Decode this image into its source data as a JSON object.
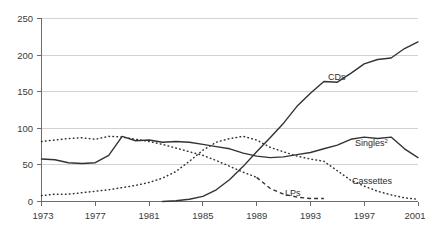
{
  "chart_data": {
    "type": "line",
    "title": "",
    "xlabel": "",
    "ylabel": "",
    "xlim": [
      1973,
      2001
    ],
    "ylim": [
      0,
      250
    ],
    "yticks": [
      0,
      50,
      100,
      150,
      200,
      250
    ],
    "xticks": [
      1973,
      1977,
      1981,
      1985,
      1989,
      1993,
      1997,
      2001
    ],
    "grid": true,
    "legend_position": "inline-annotations",
    "x": [
      1973,
      1974,
      1975,
      1976,
      1977,
      1978,
      1979,
      1980,
      1981,
      1982,
      1983,
      1984,
      1985,
      1986,
      1987,
      1988,
      1989,
      1990,
      1991,
      1992,
      1993,
      1994,
      1995,
      1996,
      1997,
      1998,
      1999,
      2000,
      2001
    ],
    "series": [
      {
        "name": "CDs",
        "style": "solid",
        "label": "CDs",
        "values": [
          0,
          0,
          0,
          0,
          0,
          0,
          0,
          0,
          0,
          0,
          1,
          3,
          7,
          16,
          30,
          48,
          68,
          87,
          107,
          130,
          148,
          164,
          163,
          175,
          188,
          194,
          196,
          209,
          218
        ]
      },
      {
        "name": "Singles",
        "style": "solid",
        "label": "Singles",
        "label_superscript": "2",
        "values": [
          58,
          57,
          53,
          52,
          53,
          63,
          89,
          83,
          84,
          81,
          82,
          81,
          78,
          75,
          72,
          66,
          62,
          60,
          61,
          64,
          67,
          72,
          77,
          85,
          88,
          86,
          88,
          72,
          60
        ]
      },
      {
        "name": "Cassettes",
        "style": "dotted",
        "label": "Cassettes",
        "values": [
          8,
          10,
          10,
          12,
          14,
          16,
          19,
          22,
          26,
          32,
          41,
          55,
          70,
          81,
          86,
          89,
          84,
          74,
          68,
          62,
          58,
          55,
          42,
          29,
          21,
          14,
          9,
          5,
          3
        ]
      },
      {
        "name": "LPs",
        "style": "dotted-dashed",
        "label": "LPs",
        "values": [
          82,
          84,
          86,
          87,
          85,
          89,
          88,
          85,
          82,
          78,
          73,
          68,
          63,
          56,
          48,
          40,
          33,
          18,
          10,
          6,
          4,
          4,
          3,
          3,
          3,
          3,
          3,
          3,
          3
        ]
      }
    ]
  },
  "axes": {
    "y_labels": [
      "250",
      "200",
      "150",
      "100",
      "50",
      "0"
    ],
    "x_labels": [
      "1973",
      "1977",
      "1981",
      "1985",
      "1989",
      "1993",
      "1997",
      "2001"
    ]
  },
  "annotations": {
    "cds": "CDs",
    "singles": "Singles",
    "singles_sup": "2",
    "cassettes": "Cassettes",
    "lps": "LPs"
  },
  "colors": {
    "line": "#333333",
    "grid": "#d2d2d2",
    "axis": "#6b6b6b",
    "text": "#3a3a3a",
    "background": "#ffffff"
  }
}
